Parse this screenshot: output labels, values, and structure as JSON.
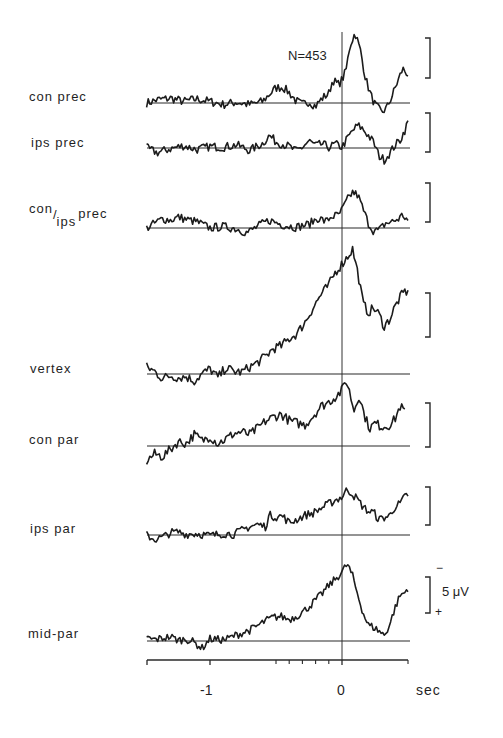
{
  "chart_data": {
    "type": "line",
    "title": "",
    "annotation": "N=453",
    "xlabel": "sec",
    "xlim": [
      -1.48,
      0.5
    ],
    "x_ticks": [
      {
        "value": -1,
        "label": "-1"
      },
      {
        "value": 0,
        "label": "0"
      }
    ],
    "x_minor_ticks": [
      -0.5,
      -0.4,
      -0.3,
      -0.2,
      -0.1,
      0.5
    ],
    "scale_bar": {
      "label": "5 μV",
      "value_uV": 5,
      "negative_up": true,
      "top_sign": "−",
      "bottom_sign": "+"
    },
    "vertical_marker": 0,
    "series": [
      {
        "name": "con prec",
        "label_main": "con prec",
        "points": [
          [
            -1.48,
            0
          ],
          [
            -1.4,
            0.4
          ],
          [
            -1.3,
            0.6
          ],
          [
            -1.2,
            0.2
          ],
          [
            -1.1,
            0.5
          ],
          [
            -1.0,
            0.2
          ],
          [
            -0.9,
            -0.2
          ],
          [
            -0.8,
            0.1
          ],
          [
            -0.7,
            -0.2
          ],
          [
            -0.6,
            0.2
          ],
          [
            -0.55,
            1.1
          ],
          [
            -0.5,
            1.9
          ],
          [
            -0.45,
            2.0
          ],
          [
            -0.4,
            1.3
          ],
          [
            -0.35,
            0.3
          ],
          [
            -0.3,
            -0.2
          ],
          [
            -0.25,
            0.2
          ],
          [
            -0.2,
            -0.4
          ],
          [
            -0.15,
            0.6
          ],
          [
            -0.1,
            1.2
          ],
          [
            -0.07,
            2.9
          ],
          [
            -0.03,
            2.3
          ],
          [
            0.0,
            2.9
          ],
          [
            0.03,
            4.0
          ],
          [
            0.06,
            7.2
          ],
          [
            0.1,
            8.8
          ],
          [
            0.14,
            6.5
          ],
          [
            0.18,
            3.0
          ],
          [
            0.22,
            0.9
          ],
          [
            0.25,
            -0.2
          ],
          [
            0.3,
            -1.2
          ],
          [
            0.34,
            -0.6
          ],
          [
            0.38,
            0.9
          ],
          [
            0.42,
            2.6
          ],
          [
            0.46,
            4.3
          ],
          [
            0.5,
            3.6
          ]
        ]
      },
      {
        "name": "ips prec",
        "label_main": "ips prec",
        "points": [
          [
            -1.48,
            0
          ],
          [
            -1.4,
            -0.6
          ],
          [
            -1.3,
            -0.1
          ],
          [
            -1.2,
            0.3
          ],
          [
            -1.1,
            -0.2
          ],
          [
            -1.0,
            0.2
          ],
          [
            -0.9,
            0.1
          ],
          [
            -0.8,
            0.4
          ],
          [
            -0.7,
            -0.3
          ],
          [
            -0.6,
            0.6
          ],
          [
            -0.55,
            1.6
          ],
          [
            -0.5,
            0.8
          ],
          [
            -0.45,
            0.5
          ],
          [
            -0.4,
            0.2
          ],
          [
            -0.35,
            -0.4
          ],
          [
            -0.3,
            0.1
          ],
          [
            -0.25,
            0.9
          ],
          [
            -0.2,
            0.3
          ],
          [
            -0.15,
            0.5
          ],
          [
            -0.1,
            0.1
          ],
          [
            -0.05,
            0.5
          ],
          [
            0.0,
            0.1
          ],
          [
            0.04,
            1.2
          ],
          [
            0.08,
            2.2
          ],
          [
            0.12,
            2.9
          ],
          [
            0.16,
            2.4
          ],
          [
            0.2,
            1.6
          ],
          [
            0.24,
            0.7
          ],
          [
            0.28,
            -1.0
          ],
          [
            0.32,
            -1.5
          ],
          [
            0.36,
            -0.7
          ],
          [
            0.4,
            0.3
          ],
          [
            0.44,
            1.0
          ],
          [
            0.48,
            2.4
          ],
          [
            0.5,
            3.4
          ]
        ]
      },
      {
        "name": "con/ips prec",
        "label_main": "con",
        "label_sub": "ips",
        "label_suffix": "prec",
        "points": [
          [
            -1.48,
            0
          ],
          [
            -1.42,
            0.6
          ],
          [
            -1.36,
            1.2
          ],
          [
            -1.3,
            1.0
          ],
          [
            -1.24,
            1.4
          ],
          [
            -1.18,
            1.1
          ],
          [
            -1.1,
            0.8
          ],
          [
            -1.0,
            0.0
          ],
          [
            -0.9,
            0.2
          ],
          [
            -0.8,
            -0.1
          ],
          [
            -0.72,
            -0.6
          ],
          [
            -0.62,
            0.4
          ],
          [
            -0.55,
            1.0
          ],
          [
            -0.45,
            0.4
          ],
          [
            -0.35,
            0.1
          ],
          [
            -0.25,
            0.5
          ],
          [
            -0.18,
            1.3
          ],
          [
            -0.12,
            0.8
          ],
          [
            -0.08,
            1.5
          ],
          [
            -0.03,
            1.6
          ],
          [
            0.0,
            2.3
          ],
          [
            0.04,
            3.6
          ],
          [
            0.08,
            4.6
          ],
          [
            0.12,
            4.2
          ],
          [
            0.16,
            2.4
          ],
          [
            0.2,
            0.6
          ],
          [
            0.24,
            -0.4
          ],
          [
            0.28,
            -0.3
          ],
          [
            0.33,
            0.6
          ],
          [
            0.38,
            0.8
          ],
          [
            0.43,
            1.2
          ],
          [
            0.46,
            1.7
          ],
          [
            0.5,
            0.9
          ]
        ]
      },
      {
        "name": "vertex",
        "label_main": "vertex",
        "points": [
          [
            -1.48,
            0.8
          ],
          [
            -1.42,
            0.3
          ],
          [
            -1.36,
            -0.5
          ],
          [
            -1.3,
            -0.2
          ],
          [
            -1.24,
            -0.4
          ],
          [
            -1.18,
            -0.3
          ],
          [
            -1.12,
            -0.8
          ],
          [
            -1.06,
            0.0
          ],
          [
            -1.0,
            0.6
          ],
          [
            -0.94,
            -0.4
          ],
          [
            -0.88,
            0.7
          ],
          [
            -0.82,
            0.3
          ],
          [
            -0.76,
            0.2
          ],
          [
            -0.7,
            0.8
          ],
          [
            -0.64,
            1.3
          ],
          [
            -0.58,
            2.0
          ],
          [
            -0.52,
            2.9
          ],
          [
            -0.46,
            3.2
          ],
          [
            -0.4,
            4.0
          ],
          [
            -0.34,
            4.6
          ],
          [
            -0.28,
            5.9
          ],
          [
            -0.22,
            7.5
          ],
          [
            -0.16,
            9.0
          ],
          [
            -0.1,
            10.1
          ],
          [
            -0.05,
            11.6
          ],
          [
            0.0,
            12.5
          ],
          [
            0.04,
            13.3
          ],
          [
            0.08,
            14.2
          ],
          [
            0.12,
            11.5
          ],
          [
            0.16,
            8.0
          ],
          [
            0.2,
            7.0
          ],
          [
            0.24,
            7.5
          ],
          [
            0.28,
            6.8
          ],
          [
            0.32,
            5.4
          ],
          [
            0.36,
            6.2
          ],
          [
            0.4,
            7.6
          ],
          [
            0.44,
            8.7
          ],
          [
            0.48,
            9.5
          ],
          [
            0.5,
            9.1
          ]
        ]
      },
      {
        "name": "con par",
        "label_main": "con par",
        "points": [
          [
            -1.48,
            -1.7
          ],
          [
            -1.42,
            -0.9
          ],
          [
            -1.36,
            -1.2
          ],
          [
            -1.3,
            -0.4
          ],
          [
            -1.24,
            0.5
          ],
          [
            -1.18,
            0.3
          ],
          [
            -1.12,
            1.3
          ],
          [
            -1.06,
            0.6
          ],
          [
            -1.0,
            1.1
          ],
          [
            -0.94,
            0.3
          ],
          [
            -0.88,
            0.8
          ],
          [
            -0.82,
            1.4
          ],
          [
            -0.76,
            1.6
          ],
          [
            -0.7,
            1.3
          ],
          [
            -0.64,
            2.0
          ],
          [
            -0.58,
            2.8
          ],
          [
            -0.52,
            3.3
          ],
          [
            -0.46,
            3.6
          ],
          [
            -0.4,
            2.9
          ],
          [
            -0.34,
            2.6
          ],
          [
            -0.28,
            2.4
          ],
          [
            -0.22,
            3.4
          ],
          [
            -0.16,
            4.5
          ],
          [
            -0.1,
            5.0
          ],
          [
            -0.05,
            5.6
          ],
          [
            0.0,
            6.3
          ],
          [
            0.03,
            7.5
          ],
          [
            0.06,
            6.0
          ],
          [
            0.09,
            4.0
          ],
          [
            0.13,
            5.8
          ],
          [
            0.17,
            3.5
          ],
          [
            0.21,
            2.0
          ],
          [
            0.25,
            2.6
          ],
          [
            0.3,
            2.2
          ],
          [
            0.35,
            2.3
          ],
          [
            0.4,
            3.0
          ],
          [
            0.44,
            4.5
          ],
          [
            0.48,
            3.9
          ]
        ]
      },
      {
        "name": "ips par",
        "label_main": "ips par",
        "points": [
          [
            -1.48,
            0
          ],
          [
            -1.42,
            -0.6
          ],
          [
            -1.36,
            -0.3
          ],
          [
            -1.3,
            0.3
          ],
          [
            -1.24,
            0.4
          ],
          [
            -1.18,
            0.1
          ],
          [
            -1.1,
            0.2
          ],
          [
            -1.0,
            -0.1
          ],
          [
            -0.9,
            0.2
          ],
          [
            -0.82,
            0.1
          ],
          [
            -0.76,
            0.6
          ],
          [
            -0.7,
            1.1
          ],
          [
            -0.64,
            1.4
          ],
          [
            -0.58,
            1.1
          ],
          [
            -0.55,
            2.6
          ],
          [
            -0.5,
            2.4
          ],
          [
            -0.45,
            2.5
          ],
          [
            -0.4,
            1.6
          ],
          [
            -0.35,
            2.0
          ],
          [
            -0.28,
            2.6
          ],
          [
            -0.22,
            2.9
          ],
          [
            -0.16,
            3.5
          ],
          [
            -0.1,
            4.1
          ],
          [
            -0.05,
            4.6
          ],
          [
            0.0,
            5.0
          ],
          [
            0.04,
            6.0
          ],
          [
            0.08,
            5.4
          ],
          [
            0.12,
            4.6
          ],
          [
            0.16,
            3.7
          ],
          [
            0.2,
            3.1
          ],
          [
            0.24,
            3.0
          ],
          [
            0.28,
            2.0
          ],
          [
            0.32,
            2.3
          ],
          [
            0.36,
            2.5
          ],
          [
            0.4,
            3.7
          ],
          [
            0.44,
            4.1
          ],
          [
            0.48,
            5.1
          ],
          [
            0.5,
            5.3
          ]
        ]
      },
      {
        "name": "mid-par",
        "label_main": "mid-par",
        "points": [
          [
            -1.48,
            0.4
          ],
          [
            -1.42,
            0.2
          ],
          [
            -1.36,
            0.4
          ],
          [
            -1.3,
            0.6
          ],
          [
            -1.24,
            0.1
          ],
          [
            -1.18,
            0.3
          ],
          [
            -1.12,
            -0.2
          ],
          [
            -1.06,
            -1.0
          ],
          [
            -1.0,
            0.3
          ],
          [
            -0.94,
            0.2
          ],
          [
            -0.88,
            0.2
          ],
          [
            -0.82,
            0.7
          ],
          [
            -0.76,
            1.1
          ],
          [
            -0.7,
            1.5
          ],
          [
            -0.64,
            2.1
          ],
          [
            -0.58,
            2.8
          ],
          [
            -0.52,
            3.3
          ],
          [
            -0.46,
            3.4
          ],
          [
            -0.4,
            3.0
          ],
          [
            -0.34,
            3.5
          ],
          [
            -0.28,
            4.3
          ],
          [
            -0.22,
            5.3
          ],
          [
            -0.16,
            6.4
          ],
          [
            -0.1,
            7.7
          ],
          [
            -0.05,
            8.6
          ],
          [
            0.0,
            9.6
          ],
          [
            0.04,
            10.7
          ],
          [
            0.08,
            9.0
          ],
          [
            0.12,
            6.4
          ],
          [
            0.16,
            3.9
          ],
          [
            0.2,
            2.2
          ],
          [
            0.24,
            1.9
          ],
          [
            0.28,
            1.4
          ],
          [
            0.32,
            0.8
          ],
          [
            0.36,
            2.2
          ],
          [
            0.4,
            4.5
          ],
          [
            0.44,
            6.3
          ],
          [
            0.48,
            6.8
          ],
          [
            0.5,
            7.4
          ]
        ]
      }
    ]
  },
  "labels": {
    "annotation": "N=453",
    "x_axis_unit": "sec",
    "tick_minus1": "-1",
    "tick_0": "0",
    "scale_value": "5 μV",
    "scale_minus": "−",
    "scale_plus": "+",
    "series_names": [
      "con prec",
      "ips prec",
      "con",
      "ips",
      "prec",
      "vertex",
      "con par",
      "ips par",
      "mid-par"
    ]
  }
}
